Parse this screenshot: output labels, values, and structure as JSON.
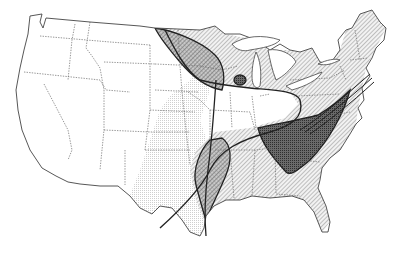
{
  "map": {
    "subject": "United States outline map with state borders and overlaid distribution zones",
    "region": "Contiguous United States",
    "colors": {
      "background": "#ffffff",
      "border": "#555555",
      "coast": "#444444",
      "stipple": "#d8d8d8",
      "hatch": "#8a8a8a",
      "dense_zone": "#555555",
      "boundary_line": "#222222"
    },
    "zones": [
      {
        "id": "stippled-plains",
        "pattern": "stipple",
        "description": "Great Plains light stippled region"
      },
      {
        "id": "hatched-east",
        "pattern": "diagonal-hatch",
        "description": "Eastern US diagonal hatched region"
      },
      {
        "id": "northern-lobe",
        "pattern": "cross-hatch",
        "description": "Upper Midwest elongated overlap zone"
      },
      {
        "id": "wisconsin-spot",
        "pattern": "dense",
        "description": "Small dark patch in Wisconsin"
      },
      {
        "id": "southern-lobe",
        "pattern": "cross-hatch",
        "description": "Arkansas/Louisiana overlap zone"
      },
      {
        "id": "appalachian-core",
        "pattern": "dense",
        "description": "Tennessee/Carolinas dark core extending along Atlantic coast"
      }
    ],
    "boundary_lines": [
      {
        "id": "s-curve",
        "description": "S-shaped boundary line from Texas through Midwest to Atlantic coast"
      },
      {
        "id": "texas-line",
        "description": "Near-vertical line in east Texas"
      }
    ]
  }
}
